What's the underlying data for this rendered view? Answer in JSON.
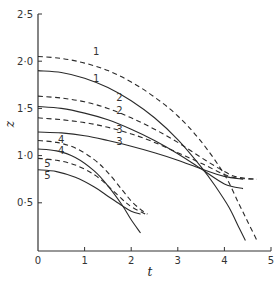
{
  "chart_data": {
    "type": "line",
    "title": "",
    "xlabel": "t",
    "ylabel": "z",
    "xlim": [
      0,
      5
    ],
    "ylim": [
      0,
      2.5
    ],
    "xticks": [
      "0",
      "1",
      "2",
      "3",
      "4",
      "5"
    ],
    "yticks": [
      "0·5",
      "1·0",
      "1·5",
      "2·0",
      "2·5"
    ],
    "grid": false,
    "legend": "inline numeric labels 1–5 near curve starts; dashed and solid pairs share a label",
    "series": [
      {
        "name": "1",
        "style": "dashed",
        "x": [
          0,
          0.5,
          1,
          1.5,
          2,
          2.5,
          3,
          3.5,
          4,
          4.3,
          4.5,
          4.7
        ],
        "y": [
          2.05,
          2.03,
          1.98,
          1.9,
          1.78,
          1.62,
          1.42,
          1.15,
          0.8,
          0.5,
          0.3,
          0.1
        ]
      },
      {
        "name": "1",
        "style": "solid",
        "x": [
          0,
          0.5,
          1,
          1.5,
          2,
          2.5,
          3,
          3.5,
          3.8,
          4.1,
          4.3,
          4.45
        ],
        "y": [
          1.9,
          1.88,
          1.82,
          1.72,
          1.58,
          1.4,
          1.17,
          0.88,
          0.68,
          0.45,
          0.25,
          0.1
        ]
      },
      {
        "name": "2",
        "style": "dashed",
        "x": [
          0,
          0.5,
          1,
          1.5,
          2,
          2.5,
          3,
          3.5,
          4,
          4.3,
          4.7
        ],
        "y": [
          1.63,
          1.61,
          1.57,
          1.5,
          1.4,
          1.28,
          1.14,
          0.98,
          0.83,
          0.77,
          0.75
        ]
      },
      {
        "name": "2",
        "style": "solid",
        "x": [
          0,
          0.5,
          1,
          1.5,
          2,
          2.5,
          3,
          3.5,
          4,
          4.4
        ],
        "y": [
          1.52,
          1.5,
          1.45,
          1.38,
          1.28,
          1.16,
          1.02,
          0.86,
          0.7,
          0.65
        ]
      },
      {
        "name": "3",
        "style": "dashed",
        "x": [
          0,
          0.5,
          1,
          1.5,
          2,
          2.5,
          3,
          3.5,
          4,
          4.3,
          4.7
        ],
        "y": [
          1.4,
          1.38,
          1.35,
          1.3,
          1.23,
          1.14,
          1.03,
          0.92,
          0.8,
          0.76,
          0.75
        ]
      },
      {
        "name": "3",
        "style": "solid",
        "x": [
          0,
          0.5,
          1,
          1.5,
          2,
          2.5,
          3,
          3.5,
          4,
          4.4
        ],
        "y": [
          1.25,
          1.24,
          1.21,
          1.16,
          1.1,
          1.03,
          0.95,
          0.86,
          0.78,
          0.75
        ]
      },
      {
        "name": "4",
        "style": "dashed",
        "x": [
          0,
          0.4,
          0.8,
          1.2,
          1.5,
          1.8,
          2.0,
          2.2,
          2.35
        ],
        "y": [
          1.16,
          1.14,
          1.08,
          0.96,
          0.82,
          0.64,
          0.52,
          0.43,
          0.38
        ]
      },
      {
        "name": "4",
        "style": "solid",
        "x": [
          0,
          0.4,
          0.8,
          1.2,
          1.5,
          1.8,
          2.0,
          2.2
        ],
        "y": [
          1.07,
          1.05,
          0.98,
          0.84,
          0.68,
          0.48,
          0.32,
          0.18
        ]
      },
      {
        "name": "5",
        "style": "dashed",
        "x": [
          0,
          0.4,
          0.8,
          1.2,
          1.5,
          1.8,
          2.0,
          2.3
        ],
        "y": [
          0.97,
          0.95,
          0.9,
          0.8,
          0.68,
          0.54,
          0.46,
          0.38
        ]
      },
      {
        "name": "5",
        "style": "solid",
        "x": [
          0,
          0.4,
          0.8,
          1.2,
          1.5,
          1.8,
          2.0,
          2.2
        ],
        "y": [
          0.85,
          0.83,
          0.77,
          0.67,
          0.57,
          0.47,
          0.41,
          0.38
        ]
      }
    ],
    "labels": [
      {
        "text": "1",
        "t": 1.25,
        "z": 2.1
      },
      {
        "text": "1",
        "t": 1.25,
        "z": 1.82
      },
      {
        "text": "2",
        "t": 1.75,
        "z": 1.62
      },
      {
        "text": "2",
        "t": 1.75,
        "z": 1.48
      },
      {
        "text": "3",
        "t": 1.75,
        "z": 1.28
      },
      {
        "text": "3",
        "t": 1.75,
        "z": 1.15
      },
      {
        "text": "4",
        "t": 0.5,
        "z": 1.17
      },
      {
        "text": "4",
        "t": 0.5,
        "z": 1.05
      },
      {
        "text": "5",
        "t": 0.2,
        "z": 0.92
      },
      {
        "text": "5",
        "t": 0.2,
        "z": 0.79
      }
    ]
  }
}
